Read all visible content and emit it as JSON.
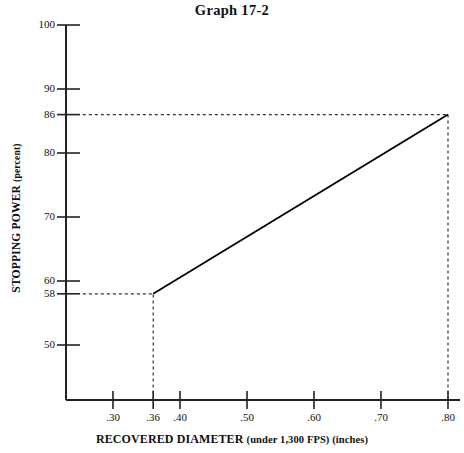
{
  "chart_data": {
    "type": "line",
    "title": "Graph 17-2",
    "xlabel_main": "RECOVERED DIAMETER",
    "xlabel_sub": "(under 1,300 FPS) (inches)",
    "ylabel_main": "STOPPING POWER",
    "ylabel_sub": "(percent)",
    "xlim": [
      0.255,
      0.825
    ],
    "ylim": [
      41.5,
      100
    ],
    "grid": false,
    "legend": "none",
    "line_color": "#000000",
    "axis_color": "#222222",
    "guide_color": "#333333",
    "background": "#ffffff",
    "x_ticks": [
      0.3,
      0.36,
      0.4,
      0.5,
      0.6,
      0.7,
      0.8
    ],
    "x_tick_labels": [
      ".30",
      ".36",
      ".40",
      ".50",
      ".60",
      ".70",
      ".80"
    ],
    "y_ticks": [
      100,
      90,
      86,
      80,
      70,
      60,
      58,
      50
    ],
    "y_tick_labels": [
      "100",
      "90",
      "86",
      "80",
      "70",
      "60",
      "58",
      "50"
    ],
    "series": [
      {
        "name": "stopping power vs recovered diameter",
        "x": [
          0.36,
          0.8
        ],
        "values": [
          58,
          86
        ]
      }
    ],
    "guide_lines": [
      {
        "name": "y-58-horizontal",
        "type": "horizontal",
        "y": 58,
        "x_from": 0.255,
        "x_to": 0.36,
        "style": "dashed"
      },
      {
        "name": "x-036-vertical",
        "type": "vertical",
        "x": 0.36,
        "y_from": 41.5,
        "y_to": 58,
        "style": "dashed"
      },
      {
        "name": "y-86-horizontal",
        "type": "horizontal",
        "y": 86,
        "x_from": 0.255,
        "x_to": 0.8,
        "style": "dashed"
      },
      {
        "name": "x-080-vertical",
        "type": "vertical",
        "x": 0.8,
        "y_from": 41.5,
        "y_to": 86,
        "style": "dashed"
      }
    ],
    "annotations": []
  },
  "geometry": {
    "plot_left_px": 66,
    "plot_bottom_px": 400,
    "plot_right_px": 460,
    "plot_top_px": 25
  }
}
